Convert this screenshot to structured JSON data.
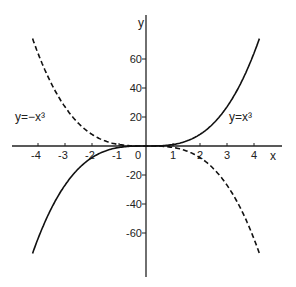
{
  "chart_data": {
    "type": "line",
    "title": "",
    "xlabel": "x",
    "ylabel": "y",
    "xlim": [
      -4.5,
      4.5
    ],
    "ylim": [
      -80,
      80
    ],
    "grid": false,
    "x_ticks": [
      -4,
      -3,
      -2,
      -1,
      0,
      1,
      2,
      3,
      4
    ],
    "y_ticks": [
      -60,
      -40,
      -20,
      20,
      40,
      60
    ],
    "series": [
      {
        "name": "y = x³",
        "style": "solid",
        "x": [
          -4.2,
          -4,
          -3,
          -2,
          -1,
          0,
          1,
          2,
          3,
          4,
          4.2
        ],
        "y": [
          -74.1,
          -64,
          -27,
          -8,
          -1,
          0,
          1,
          8,
          27,
          64,
          74.1
        ]
      },
      {
        "name": "y = −x³",
        "style": "dashed",
        "x": [
          -4.2,
          -4,
          -3,
          -2,
          -1,
          0,
          1,
          2,
          3,
          4,
          4.2
        ],
        "y": [
          74.1,
          64,
          27,
          8,
          1,
          0,
          -1,
          -8,
          -27,
          -64,
          -74.1
        ]
      }
    ],
    "annotations": [
      {
        "text": "y = x³",
        "near": [
          3.5,
          10
        ]
      },
      {
        "text": "y = −x³",
        "near": [
          -3.8,
          10
        ]
      }
    ]
  },
  "labels": {
    "x_axis": "x",
    "y_axis": "y",
    "curve_cubic": "y=x³",
    "curve_neg_cubic": "y=−x³",
    "xt": [
      "-4",
      "-3",
      "-2",
      "-1",
      "0",
      "1",
      "2",
      "3",
      "4"
    ],
    "yt": [
      "60",
      "40",
      "20",
      "-20",
      "-40",
      "-60"
    ]
  }
}
